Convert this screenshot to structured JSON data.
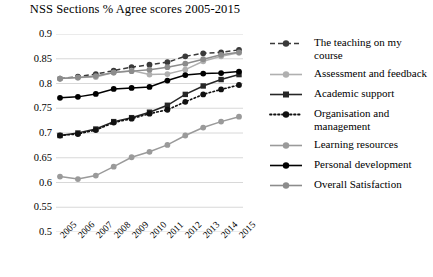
{
  "chart": {
    "title": "NSS Sections % Agree scores 2005-2015"
  },
  "axes": {
    "yticks": [
      "0.9",
      "0.85",
      "0.8",
      "0.75",
      "0.7",
      "0.65",
      "0.6",
      "0.55",
      "0.5"
    ],
    "xticks": [
      "2005",
      "2006",
      "2007",
      "2008",
      "2009",
      "2010",
      "2011",
      "2012",
      "2013",
      "2014",
      "2015"
    ]
  },
  "legend": [
    {
      "label": "The teaching on my course"
    },
    {
      "label": "Assessment and feedback"
    },
    {
      "label": "Academic support"
    },
    {
      "label": "Organisation and management"
    },
    {
      "label": "Learning resources"
    },
    {
      "label": "Personal development"
    },
    {
      "label": "Overall Satisfaction"
    }
  ],
  "chart_data": {
    "type": "line",
    "title": "NSS Sections % Agree scores 2005-2015",
    "xlabel": "",
    "ylabel": "",
    "x": [
      2005,
      2006,
      2007,
      2008,
      2009,
      2010,
      2011,
      2012,
      2013,
      2014,
      2015
    ],
    "ylim": [
      0.5,
      0.9
    ],
    "ytick_step": 0.05,
    "grid": true,
    "legend_position": "right",
    "series": [
      {
        "name": "The teaching on my course",
        "color": "#3a3a3a",
        "linestyle": "dashed",
        "marker": "circle",
        "values": [
          0.81,
          0.814,
          0.819,
          0.826,
          0.833,
          0.838,
          0.843,
          0.855,
          0.861,
          0.863,
          0.868
        ]
      },
      {
        "name": "Assessment and feedback",
        "color": "#b0b0b0",
        "linestyle": "solid",
        "marker": "circle",
        "values": [
          0.81,
          0.812,
          0.813,
          0.822,
          0.826,
          0.818,
          0.819,
          0.828,
          0.845,
          0.855,
          0.862
        ]
      },
      {
        "name": "Academic support",
        "color": "#262626",
        "linestyle": "solid",
        "marker": "square",
        "values": [
          0.695,
          0.7,
          0.708,
          0.723,
          0.731,
          0.742,
          0.756,
          0.778,
          0.795,
          0.808,
          0.818
        ]
      },
      {
        "name": "Organisation and management",
        "color": "#111111",
        "linestyle": "dotted",
        "marker": "circle",
        "values": [
          0.695,
          0.698,
          0.706,
          0.721,
          0.729,
          0.739,
          0.747,
          0.763,
          0.778,
          0.788,
          0.797
        ]
      },
      {
        "name": "Learning resources",
        "color": "#9a9a9a",
        "linestyle": "solid",
        "marker": "circle",
        "values": [
          0.612,
          0.607,
          0.614,
          0.632,
          0.651,
          0.662,
          0.676,
          0.695,
          0.711,
          0.723,
          0.733
        ]
      },
      {
        "name": "Personal development",
        "color": "#000000",
        "linestyle": "solid",
        "marker": "circle",
        "values": [
          0.771,
          0.773,
          0.779,
          0.789,
          0.791,
          0.793,
          0.806,
          0.817,
          0.82,
          0.821,
          0.824
        ]
      },
      {
        "name": "Overall Satisfaction",
        "color": "#8c8c8c",
        "linestyle": "solid",
        "marker": "circle",
        "values": [
          0.81,
          0.812,
          0.815,
          0.822,
          0.825,
          0.828,
          0.833,
          0.84,
          0.849,
          0.858,
          0.863
        ]
      }
    ]
  }
}
